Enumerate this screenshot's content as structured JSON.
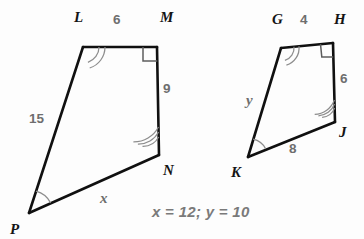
{
  "figure": {
    "background_color": "#fdfdfd",
    "stroke_color": "#101010",
    "label_color": "#6e6e6e",
    "vertex_label_color": "#141414"
  },
  "left_quadrilateral": {
    "name": "LMNP",
    "vertices": [
      {
        "label": "L",
        "x": 83,
        "y": 47,
        "label_x": 74,
        "label_y": 22
      },
      {
        "label": "M",
        "x": 157,
        "y": 47,
        "label_x": 160,
        "label_y": 22
      },
      {
        "label": "N",
        "x": 159,
        "y": 155,
        "label_x": 163,
        "label_y": 175
      },
      {
        "label": "P",
        "x": 29,
        "y": 213,
        "label_x": 10,
        "label_y": 234
      }
    ],
    "sides": [
      {
        "from": "L",
        "to": "M",
        "label": "6",
        "label_x": 113,
        "label_y": 24
      },
      {
        "from": "M",
        "to": "N",
        "label": "9",
        "label_x": 163,
        "label_y": 93
      },
      {
        "from": "N",
        "to": "P",
        "label": "x",
        "label_x": 100,
        "label_y": 203,
        "is_variable": true
      },
      {
        "from": "P",
        "to": "L",
        "label": "15",
        "label_x": 29,
        "label_y": 123
      }
    ],
    "angle_marks": [
      {
        "vertex": "L",
        "arcs": 2
      },
      {
        "vertex": "M",
        "arcs": 0,
        "right_angle": true
      },
      {
        "vertex": "N",
        "arcs": 3
      },
      {
        "vertex": "P",
        "arcs": 1
      }
    ]
  },
  "right_quadrilateral": {
    "name": "GHJK",
    "vertices": [
      {
        "label": "G",
        "x": 281,
        "y": 48,
        "label_x": 272,
        "label_y": 24
      },
      {
        "label": "H",
        "x": 333,
        "y": 43,
        "label_x": 334,
        "label_y": 24
      },
      {
        "label": "J",
        "x": 335,
        "y": 122,
        "label_x": 339,
        "label_y": 137
      },
      {
        "label": "K",
        "x": 248,
        "y": 157,
        "label_x": 231,
        "label_y": 177
      }
    ],
    "sides": [
      {
        "from": "G",
        "to": "H",
        "label": "4",
        "label_x": 300,
        "label_y": 24
      },
      {
        "from": "H",
        "to": "J",
        "label": "6",
        "label_x": 340,
        "label_y": 83
      },
      {
        "from": "J",
        "to": "K",
        "label": "8",
        "label_x": 289,
        "label_y": 153
      },
      {
        "from": "K",
        "to": "G",
        "label": "y",
        "label_x": 246,
        "label_y": 105,
        "is_variable": true
      }
    ],
    "angle_marks": [
      {
        "vertex": "G",
        "arcs": 2
      },
      {
        "vertex": "H",
        "arcs": 0,
        "right_angle": true
      },
      {
        "vertex": "J",
        "arcs": 3
      },
      {
        "vertex": "K",
        "arcs": 1
      }
    ]
  },
  "answer": {
    "text": "x = 12; y = 10",
    "x_value": 12,
    "y_value": 10
  }
}
